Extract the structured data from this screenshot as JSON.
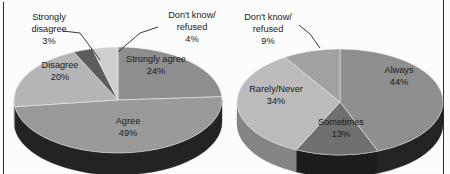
{
  "figure": {
    "background_color": "#fdfdfd",
    "border_color": "#2b2b2b",
    "label_color": "#1a1a1a"
  },
  "chart_data": [
    {
      "type": "pie",
      "title": "",
      "name": "left-pie-agreement",
      "three_d": true,
      "legend": "none",
      "labels_position": "inside-and-callout",
      "categories": [
        "Strongly agree",
        "Agree",
        "Disagree",
        "Strongly disagree",
        "Don't know/ refused"
      ],
      "values": [
        24,
        49,
        20,
        3,
        4
      ],
      "value_labels": [
        "24%",
        "49%",
        "20%",
        "3%",
        "4%"
      ],
      "colors": [
        "#8e8e8e",
        "#9a9a9a",
        "#b6b6b6",
        "#5d5d5d",
        "#cfcfcf"
      ],
      "side_colors": [
        "#4a4a4a",
        "#232323",
        "#7d7d7d",
        "#3a3a3a",
        "#9c9c9c"
      ],
      "slices": [
        {
          "label": "Strongly agree",
          "value": 24,
          "value_label": "24%",
          "callout": false
        },
        {
          "label": "Agree",
          "value": 49,
          "value_label": "49%",
          "callout": false
        },
        {
          "label": "Disagree",
          "value": 20,
          "value_label": "20%",
          "callout": false
        },
        {
          "label": "Strongly disagree",
          "value": 3,
          "value_label": "3%",
          "callout": true
        },
        {
          "label": "Don't know/ refused",
          "value": 4,
          "value_label": "4%",
          "callout": true
        }
      ]
    },
    {
      "type": "pie",
      "title": "",
      "name": "right-pie-frequency",
      "three_d": true,
      "legend": "none",
      "labels_position": "inside-and-callout",
      "categories": [
        "Always",
        "Sometimes",
        "Rarely/Never",
        "Don't know/ refused"
      ],
      "values": [
        44,
        13,
        34,
        9
      ],
      "value_labels": [
        "44%",
        "13%",
        "34%",
        "9%"
      ],
      "colors": [
        "#8f8f8f",
        "#707070",
        "#bcbcbc",
        "#a2a2a2"
      ],
      "side_colors": [
        "#242424",
        "#1c1c1c",
        "#858585",
        "#6e6e6e"
      ],
      "slices": [
        {
          "label": "Always",
          "value": 44,
          "value_label": "44%",
          "callout": false
        },
        {
          "label": "Sometimes",
          "value": 13,
          "value_label": "13%",
          "callout": false
        },
        {
          "label": "Rarely/Never",
          "value": 34,
          "value_label": "34%",
          "callout": false
        },
        {
          "label": "Don't know/ refused",
          "value": 9,
          "value_label": "9%",
          "callout": true
        }
      ]
    }
  ],
  "left_chart": {
    "strongly_disagree_line1": "Strongly",
    "strongly_disagree_line2": "disagree",
    "strongly_disagree_pct": "3%",
    "dont_know_line1": "Don't know/",
    "dont_know_line2": "refused",
    "dont_know_pct": "4%",
    "disagree_label": "Disagree",
    "disagree_pct": "20%",
    "strongly_agree_label": "Strongly agree",
    "strongly_agree_pct": "24%",
    "agree_label": "Agree",
    "agree_pct": "49%"
  },
  "right_chart": {
    "dont_know_line1": "Don't know/",
    "dont_know_line2": "refused",
    "dont_know_pct": "9%",
    "always_label": "Always",
    "always_pct": "44%",
    "rarely_never_label": "Rarely/Never",
    "rarely_never_pct": "34%",
    "sometimes_label": "Sometimes",
    "sometimes_pct": "13%"
  }
}
